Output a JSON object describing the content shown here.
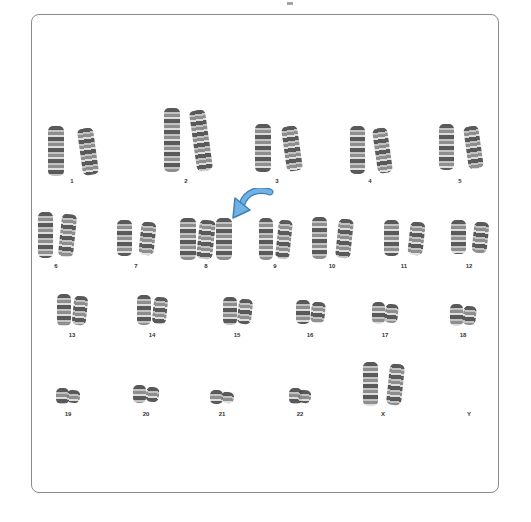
{
  "figure": {
    "type": "karyotype",
    "highlight_color": "#5a9fd4",
    "highlight_target": "8",
    "frame_border_color": "#8a8a8a"
  },
  "rows": [
    {
      "chromosomes": [
        {
          "label": "1",
          "copies": 2,
          "x": 72,
          "w": 48,
          "h": 50,
          "top": 126
        },
        {
          "label": "2",
          "copies": 2,
          "x": 186,
          "w": 44,
          "h": 64,
          "top": 108
        },
        {
          "label": "3",
          "copies": 2,
          "x": 277,
          "w": 44,
          "h": 48,
          "top": 124
        },
        {
          "label": "4",
          "copies": 2,
          "x": 370,
          "w": 40,
          "h": 48,
          "top": 126
        },
        {
          "label": "5",
          "copies": 2,
          "x": 460,
          "w": 42,
          "h": 46,
          "top": 124
        }
      ],
      "label_y": 178
    },
    {
      "chromosomes": [
        {
          "label": "6",
          "copies": 2,
          "x": 56,
          "w": 36,
          "h": 46,
          "top": 212
        },
        {
          "label": "7",
          "copies": 2,
          "x": 136,
          "w": 38,
          "h": 36,
          "top": 220
        },
        {
          "label": "8",
          "copies": 3,
          "x": 206,
          "w": 52,
          "h": 42,
          "top": 218
        },
        {
          "label": "9",
          "copies": 2,
          "x": 275,
          "w": 32,
          "h": 42,
          "top": 218
        },
        {
          "label": "10",
          "copies": 2,
          "x": 332,
          "w": 40,
          "h": 42,
          "top": 217
        },
        {
          "label": "11",
          "copies": 2,
          "x": 404,
          "w": 40,
          "h": 36,
          "top": 220
        },
        {
          "label": "12",
          "copies": 2,
          "x": 469,
          "w": 36,
          "h": 34,
          "top": 220
        }
      ],
      "label_y": 263
    },
    {
      "chromosomes": [
        {
          "label": "13",
          "copies": 2,
          "x": 72,
          "w": 30,
          "h": 32,
          "top": 294
        },
        {
          "label": "14",
          "copies": 2,
          "x": 152,
          "w": 30,
          "h": 30,
          "top": 295
        },
        {
          "label": "15",
          "copies": 2,
          "x": 237,
          "w": 28,
          "h": 28,
          "top": 297
        },
        {
          "label": "16",
          "copies": 2,
          "x": 310,
          "w": 28,
          "h": 24,
          "top": 300
        },
        {
          "label": "17",
          "copies": 2,
          "x": 385,
          "w": 26,
          "h": 22,
          "top": 302
        },
        {
          "label": "18",
          "copies": 2,
          "x": 463,
          "w": 26,
          "h": 22,
          "top": 304
        }
      ],
      "label_y": 332
    },
    {
      "chromosomes": [
        {
          "label": "19",
          "copies": 2,
          "x": 68,
          "w": 24,
          "h": 16,
          "top": 388
        },
        {
          "label": "20",
          "copies": 2,
          "x": 146,
          "w": 26,
          "h": 18,
          "top": 385
        },
        {
          "label": "21",
          "copies": 2,
          "x": 222,
          "w": 24,
          "h": 14,
          "top": 390
        },
        {
          "label": "22",
          "copies": 2,
          "x": 300,
          "w": 22,
          "h": 16,
          "top": 388
        },
        {
          "label": "X",
          "copies": 2,
          "x": 383,
          "w": 40,
          "h": 44,
          "top": 362
        },
        {
          "label": "Y",
          "copies": 0,
          "x": 469,
          "w": 0,
          "h": 0,
          "top": 400
        }
      ],
      "label_y": 411
    }
  ]
}
